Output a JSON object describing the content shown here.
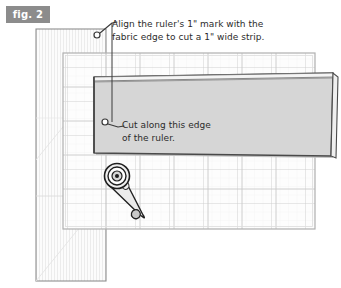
{
  "figure": {
    "label": "fig. 2",
    "alt_title": "Cutting a fabric strip with a rotary cutter and ruler on a cutting mat"
  },
  "callouts": [
    {
      "name": "align-callout",
      "text": "Align the ruler's 1\" mark with the\nfabric edge to cut a 1\" wide strip.",
      "marker_x": 97,
      "marker_y": 35,
      "leader_to_x": 117,
      "leader_to_y": 22
    },
    {
      "name": "cut-callout",
      "text": "Cut along this edge\nof the ruler.",
      "marker_x": 110,
      "marker_y": 122,
      "leader_to_x": 126,
      "leader_to_y": 128
    }
  ],
  "objects": {
    "fabric": {
      "name": "folded-fabric",
      "label": "folded fabric",
      "x": 36,
      "y": 29,
      "width": 70,
      "height": 252,
      "fill": "#fbfbfb",
      "stroke": "#8c8c8c"
    },
    "mat": {
      "name": "cutting-mat",
      "label": "cutting mat",
      "x": 63,
      "y": 53,
      "width": 252,
      "height": 176,
      "fill": "#fdfdfd",
      "stroke": "#b5b5b5",
      "grid_color": "#d8d8d8",
      "grid_minor_color": "#eaeaea",
      "grid_major_step": 34,
      "grid_minor_step": 8.5
    },
    "ruler": {
      "name": "quilting-ruler",
      "label": "quilting ruler",
      "x": 94,
      "y": 77,
      "width": 239,
      "height": 79,
      "fill": "#d5d5d5",
      "stroke": "#4a4a4a",
      "edge_highlight": "#f2f2f2"
    },
    "cutter": {
      "name": "rotary-cutter",
      "label": "rotary cutter",
      "blade_cx": 117,
      "blade_cy": 176,
      "blade_r": 12,
      "handle_tip_x": 146,
      "handle_tip_y": 216,
      "fill": "#e8e8e8",
      "stroke": "#2b2b2b"
    }
  },
  "colors": {
    "label_chip_bg": "#8c8c8c",
    "label_chip_text": "#ffffff",
    "text": "#2b2b2b",
    "leader_line": "#3a3a3a",
    "page_bg": "#ffffff"
  }
}
